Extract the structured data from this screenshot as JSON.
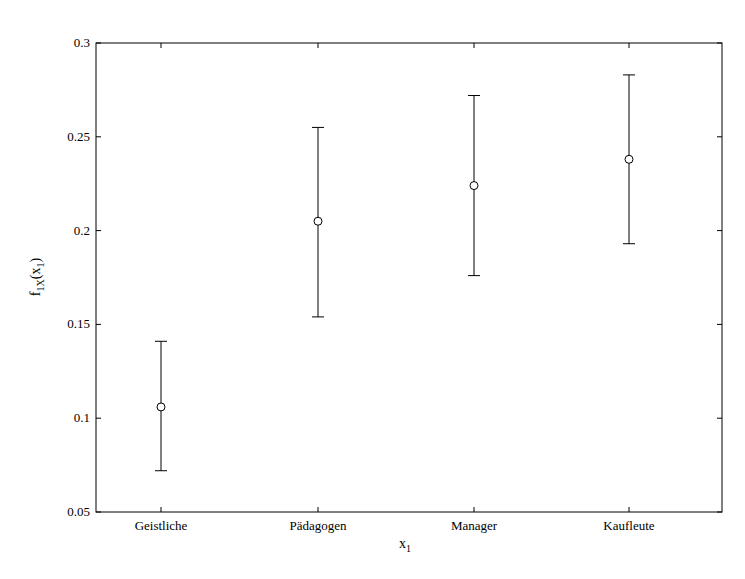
{
  "chart_data": {
    "type": "errorbar",
    "title": "",
    "xlabel": "x",
    "xlabel_sub": "1",
    "ylabel": "f",
    "ylabel_sub": "1X",
    "ylabel_arg": "(x",
    "ylabel_arg_sub": "1",
    "ylabel_close": ")",
    "categories": [
      "Geistliche",
      "Pädagogen",
      "Manager",
      "Kaufleute"
    ],
    "series": [
      {
        "name": "estimate",
        "marker": "circle",
        "values": [
          0.106,
          0.205,
          0.224,
          0.238
        ],
        "lower": [
          0.072,
          0.154,
          0.176,
          0.193
        ],
        "upper": [
          0.141,
          0.255,
          0.272,
          0.283
        ]
      }
    ],
    "ylim": [
      0.05,
      0.3
    ],
    "yticks": [
      0.05,
      0.1,
      0.15,
      0.2,
      0.25,
      0.3
    ],
    "ytick_labels": [
      "0.05",
      "0.1",
      "0.15",
      "0.2",
      "0.25",
      "0.3"
    ],
    "grid": false,
    "legend": null
  }
}
